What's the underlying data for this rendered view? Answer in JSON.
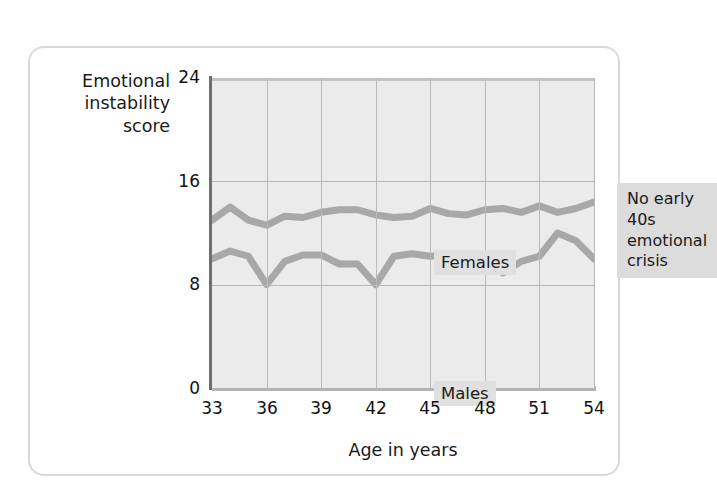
{
  "figure": {
    "y_axis_title": "Emotional\ninstability\nscore",
    "x_axis_title": "Age in years",
    "annotation": "No early 40s\nemotional crisis",
    "series_label_females": "Females",
    "series_label_males": "Males",
    "colors": {
      "line": "#a8a8a8",
      "plot_background": "#ebebeb",
      "grid": "#b9b9b9",
      "frame_border": "#d9d9d9",
      "text": "#1a1a1a"
    }
  },
  "axis": {
    "y_ticks": [
      "0",
      "8",
      "16",
      "24"
    ],
    "x_ticks": [
      "33",
      "36",
      "39",
      "42",
      "45",
      "48",
      "51",
      "54"
    ]
  },
  "chart_data": {
    "type": "line",
    "title": "",
    "xlabel": "Age in years",
    "ylabel": "Emotional instability score",
    "xlim": [
      33,
      54
    ],
    "ylim": [
      0,
      24
    ],
    "ytick_values": [
      0,
      8,
      16,
      24
    ],
    "xtick_values": [
      33,
      36,
      39,
      42,
      45,
      48,
      51,
      54
    ],
    "grid": true,
    "legend": "inline-labels",
    "annotations": [
      {
        "text": "No early 40s emotional crisis",
        "x": 45,
        "y": 20.5
      }
    ],
    "x": [
      33,
      34,
      35,
      36,
      37,
      38,
      39,
      40,
      41,
      42,
      43,
      44,
      45,
      46,
      47,
      48,
      49,
      50,
      51,
      52,
      53,
      54
    ],
    "series": [
      {
        "name": "Females",
        "values": [
          13.0,
          14.0,
          13.0,
          12.6,
          13.3,
          13.2,
          13.6,
          13.8,
          13.8,
          13.4,
          13.2,
          13.3,
          13.9,
          13.5,
          13.4,
          13.8,
          13.9,
          13.6,
          14.1,
          13.6,
          13.9,
          14.4
        ]
      },
      {
        "name": "Males",
        "values": [
          10.0,
          10.6,
          10.2,
          8.0,
          9.8,
          10.3,
          10.3,
          9.6,
          9.6,
          8.0,
          10.2,
          10.4,
          10.2,
          10.3,
          10.2,
          9.9,
          8.9,
          9.8,
          10.2,
          12.0,
          11.4,
          10.0
        ]
      }
    ]
  }
}
